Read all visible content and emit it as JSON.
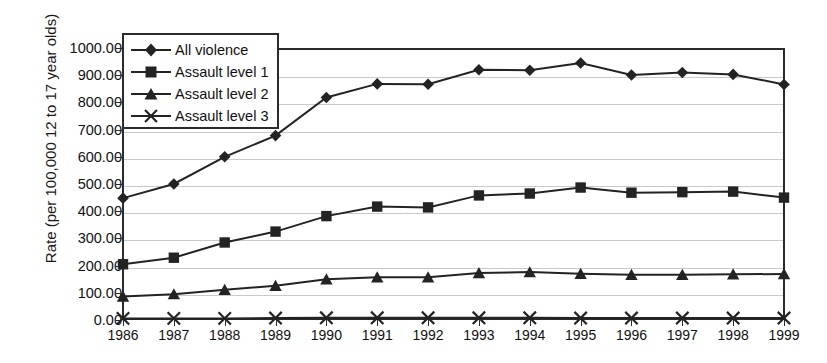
{
  "chart_data": {
    "type": "line",
    "title": "",
    "xlabel": "",
    "ylabel": "Rate (per 100,000 12 to 17 year olds)",
    "categories": [
      "1986",
      "1987",
      "1988",
      "1989",
      "1990",
      "1991",
      "1992",
      "1993",
      "1994",
      "1995",
      "1996",
      "1997",
      "1998",
      "1999"
    ],
    "ylim": [
      0,
      1000
    ],
    "ytick_labels": [
      "0.00",
      "100.00",
      "200.00",
      "300.00",
      "400.00",
      "500.00",
      "600.00",
      "700.00",
      "800.00",
      "900.00",
      "1000.00"
    ],
    "ytick_values": [
      0,
      100,
      200,
      300,
      400,
      500,
      600,
      700,
      800,
      900,
      1000
    ],
    "grid": "horizontal",
    "legend_position": "top-left-inside",
    "series": [
      {
        "name": "All violence",
        "marker": "diamond",
        "color": "#232323",
        "values": [
          448,
          500,
          600,
          678,
          818,
          868,
          867,
          920,
          918,
          945,
          901,
          910,
          903,
          866
        ]
      },
      {
        "name": "Assault level 1",
        "marker": "square",
        "color": "#232323",
        "values": [
          205,
          229,
          285,
          325,
          382,
          417,
          414,
          458,
          465,
          487,
          468,
          470,
          472,
          450
        ]
      },
      {
        "name": "Assault level 2",
        "marker": "triangle",
        "color": "#232323",
        "values": [
          86,
          95,
          111,
          126,
          150,
          157,
          157,
          173,
          176,
          170,
          166,
          166,
          168,
          169
        ]
      },
      {
        "name": "Assault level 3",
        "marker": "cross",
        "color": "#232323",
        "values": [
          6,
          6,
          6,
          7,
          8,
          8,
          8,
          8,
          8,
          7,
          7,
          7,
          7,
          7
        ]
      }
    ]
  },
  "legend": {
    "entries": [
      "All violence",
      "Assault level 1",
      "Assault level 2",
      "Assault level 3"
    ]
  },
  "colors": {
    "line": "#232323",
    "grid": "#c9c9c9",
    "frame": "#2b2b2b"
  }
}
